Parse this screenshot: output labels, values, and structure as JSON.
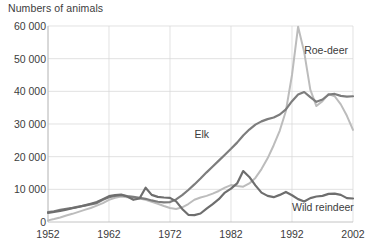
{
  "chart_data": {
    "type": "line",
    "title": "Numbers of animals",
    "xlabel": "",
    "ylabel": "Numbers of animals",
    "xlim": [
      1952,
      2002
    ],
    "ylim": [
      0,
      60000
    ],
    "grid": true,
    "legend_position": "inline-annotations",
    "x_ticks": [
      "1952",
      "1962",
      "1972",
      "1982",
      "1992",
      "2002"
    ],
    "y_ticks": [
      "0",
      "10 000",
      "20 000",
      "30 000",
      "40 000",
      "50 000",
      "60 000"
    ],
    "y_tick_values": [
      0,
      10000,
      20000,
      30000,
      40000,
      50000,
      60000
    ],
    "x_tick_values": [
      1952,
      1962,
      1972,
      1982,
      1992,
      2002
    ],
    "x": [
      1952,
      1953,
      1954,
      1955,
      1956,
      1957,
      1958,
      1959,
      1960,
      1961,
      1962,
      1963,
      1964,
      1965,
      1966,
      1967,
      1968,
      1969,
      1970,
      1971,
      1972,
      1973,
      1974,
      1975,
      1976,
      1977,
      1978,
      1979,
      1980,
      1981,
      1982,
      1983,
      1984,
      1985,
      1986,
      1987,
      1988,
      1989,
      1990,
      1991,
      1992,
      1993,
      1994,
      1995,
      1996,
      1997,
      1998,
      1999,
      2000,
      2001,
      2002
    ],
    "series": [
      {
        "name": "Elk",
        "color": "#7d7d7d",
        "width": 2.2,
        "label_x": 1976,
        "label_y": 26500,
        "values": [
          3000,
          3300,
          3700,
          4000,
          4300,
          4700,
          5000,
          5400,
          5800,
          6800,
          7600,
          8000,
          8200,
          7900,
          7700,
          7400,
          7100,
          6600,
          6200,
          6000,
          6100,
          6900,
          8200,
          9800,
          11500,
          13300,
          15200,
          17000,
          18800,
          20600,
          22400,
          24300,
          26500,
          28300,
          29800,
          30800,
          31500,
          32000,
          32900,
          34500,
          37000,
          39000,
          39800,
          38200,
          36800,
          37500,
          39000,
          39200,
          38600,
          38400,
          38500
        ]
      },
      {
        "name": "Roe-deer",
        "color": "#bcbcbc",
        "width": 2.0,
        "label_x": 1994,
        "label_y": 52500,
        "values": [
          500,
          900,
          1400,
          2000,
          2500,
          3100,
          3700,
          4300,
          5000,
          5800,
          6800,
          7400,
          7800,
          7600,
          7400,
          7200,
          6800,
          6200,
          5600,
          4900,
          4300,
          4000,
          4500,
          5500,
          6800,
          7500,
          8000,
          8700,
          9500,
          10500,
          11300,
          11000,
          10800,
          11800,
          13500,
          16200,
          19500,
          23500,
          28000,
          34000,
          45000,
          59800,
          52000,
          40500,
          35500,
          37000,
          39200,
          38500,
          36000,
          32500,
          28200
        ]
      },
      {
        "name": "Wild reindeer",
        "color": "#6e6e6e",
        "width": 2.2,
        "label_x": 1992,
        "label_y": 4200,
        "values": [
          2800,
          3100,
          3400,
          3800,
          4200,
          4600,
          5100,
          5600,
          6100,
          7000,
          7900,
          8200,
          8400,
          7800,
          6800,
          7200,
          10500,
          8300,
          7700,
          7500,
          7400,
          6300,
          4000,
          2200,
          2100,
          2600,
          4100,
          5500,
          7000,
          9000,
          10200,
          11800,
          15600,
          13800,
          11200,
          9000,
          8000,
          7600,
          8300,
          9200,
          8200,
          7000,
          6300,
          7300,
          7800,
          8000,
          8600,
          8700,
          8300,
          7300,
          7200
        ]
      }
    ]
  }
}
